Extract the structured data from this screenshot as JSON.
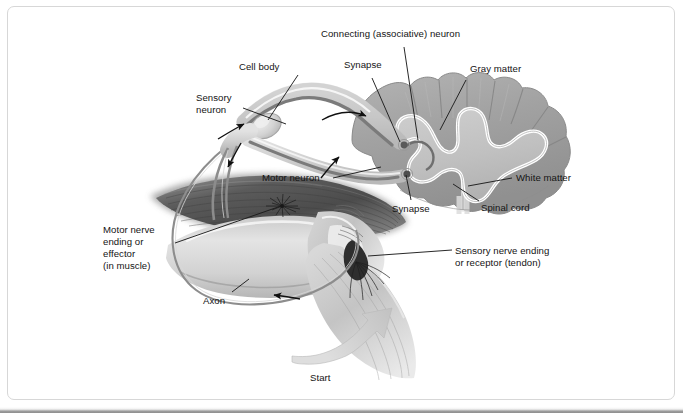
{
  "figure": {
    "background_color": "#ffffff",
    "border_color": "#d7d7d7",
    "text_color": "#141414"
  },
  "labels": {
    "connecting_neuron": "Connecting (associative) neuron",
    "synapse_top": "Synapse",
    "gray_matter": "Gray matter",
    "cell_body": "Cell body",
    "sensory_neuron_l1": "Sensory",
    "sensory_neuron_l2": "neuron",
    "motor_neuron": "Motor neuron",
    "white_matter": "White matter",
    "synapse_bottom": "Synapse",
    "spinal_cord": "Spinal cord",
    "sensory_ending_l1": "Sensory nerve ending",
    "sensory_ending_l2": "or receptor (tendon)",
    "motor_ending_l1": "Motor nerve",
    "motor_ending_l2": "ending or",
    "motor_ending_l3": "effector",
    "motor_ending_l4": "(in muscle)",
    "axon": "Axon",
    "start": "Start"
  },
  "colors": {
    "white_matter": "#a3a3a3",
    "gray_matter": "#c2c2c2",
    "gray_matter_outline": "#ffffff",
    "cord_edge": "#8a8a8a",
    "nerve_sheath": "#d2d2d2",
    "nerve_core": "#7d7d7d",
    "muscle_dark": "#565656",
    "muscle_mid": "#8f8f8f",
    "limb_light": "#dcdcdc",
    "tendon": "#c8c8c8",
    "axon_line": "#888888",
    "leader_line": "#1c1c1c",
    "arrow_black": "#101010",
    "start_arrow": "#c9c9c9"
  },
  "structures": [
    {
      "name": "spinal-cord-cross-section",
      "description": "Oval transverse section with scalloped outer rim, darker white matter ring and lighter butterfly-shaped gray matter core outlined in white, with a central canal fissure"
    },
    {
      "name": "gray-matter-butterfly",
      "description": "Lighter H / butterfly shaped central region with dorsal and ventral horns"
    },
    {
      "name": "white-matter-ring",
      "description": "Darker gray outer region of the cord bearing radial fissures"
    },
    {
      "name": "dorsal-root-ganglion",
      "description": "Bulge on the sensory root carrying the sensory neuron cell body"
    },
    {
      "name": "sensory-nerve-fiber",
      "description": "Fiber running from tendon receptor up to the dorsal horn synapse"
    },
    {
      "name": "motor-nerve-fiber",
      "description": "Fiber running from ventral horn synapse down to the muscle effector"
    },
    {
      "name": "connecting-neuron",
      "description": "Short associative interneuron linking dorsal and ventral horn synapses"
    },
    {
      "name": "muscle-belly",
      "description": "Dark striated muscle of the upper limb segment"
    },
    {
      "name": "limb-joint",
      "description": "Bent joint of the limb below the muscle"
    },
    {
      "name": "tendon",
      "description": "Tendon below the joint containing the stretch receptor"
    },
    {
      "name": "motor-end-plate",
      "description": "Star-shaped nerve ending fanning into the muscle"
    },
    {
      "name": "tendon-receptor",
      "description": "Dark fan-shaped sensory receptor in the tendon"
    },
    {
      "name": "axon-loop",
      "description": "Large rounded outline of the axon bundle looping around the limb"
    },
    {
      "name": "start-arrow",
      "description": "Thick pale curved arrow at the bottom indicating where the reflex begins"
    }
  ],
  "flow_arrows": [
    {
      "name": "arrow-sensory-up",
      "direction": "up-right",
      "pathway": "sensory"
    },
    {
      "name": "arrow-into-cord",
      "direction": "up-right",
      "pathway": "sensory"
    },
    {
      "name": "arrow-across-horns",
      "direction": "right",
      "pathway": "connecting"
    },
    {
      "name": "arrow-motor-down",
      "direction": "down-left",
      "pathway": "motor"
    },
    {
      "name": "arrow-motor-to-muscle",
      "direction": "left",
      "pathway": "motor"
    }
  ]
}
